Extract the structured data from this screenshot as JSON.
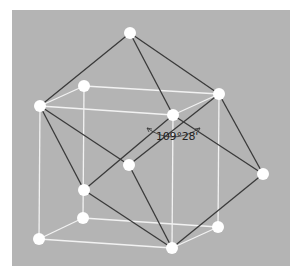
{
  "diagram": {
    "title": "",
    "colors": {
      "background": "#b4b4b4",
      "cube_edge": "#f2f2f2",
      "bond": "#3a3a3a",
      "atom": "#ffffff",
      "arc": "#333333"
    },
    "angle_label": "109°28'",
    "nodes": [
      {
        "id": "top",
        "x": 130,
        "y": 33
      },
      {
        "id": "front-top-left",
        "x": 40,
        "y": 106
      },
      {
        "id": "back-top-left",
        "x": 84,
        "y": 86
      },
      {
        "id": "front-top-right",
        "x": 173,
        "y": 115
      },
      {
        "id": "back-top-right",
        "x": 219,
        "y": 94
      },
      {
        "id": "center",
        "x": 129,
        "y": 165
      },
      {
        "id": "mid-left",
        "x": 84,
        "y": 190
      },
      {
        "id": "right",
        "x": 263,
        "y": 174
      },
      {
        "id": "back-bottom-left",
        "x": 83,
        "y": 218
      },
      {
        "id": "back-bottom-right",
        "x": 218,
        "y": 227
      },
      {
        "id": "front-bottom-left",
        "x": 39,
        "y": 239
      },
      {
        "id": "front-bottom-right",
        "x": 172,
        "y": 248
      }
    ],
    "cube_edges": [
      [
        "front-top-left",
        "front-top-right"
      ],
      [
        "front-top-right",
        "front-bottom-right"
      ],
      [
        "front-bottom-right",
        "front-bottom-left"
      ],
      [
        "front-bottom-left",
        "front-top-left"
      ],
      [
        "back-top-left",
        "back-top-right"
      ],
      [
        "back-top-right",
        "back-bottom-right"
      ],
      [
        "back-bottom-right",
        "back-bottom-left"
      ],
      [
        "back-bottom-left",
        "back-top-left"
      ],
      [
        "front-top-left",
        "back-top-left"
      ],
      [
        "front-top-right",
        "back-top-right"
      ],
      [
        "front-bottom-right",
        "back-bottom-right"
      ],
      [
        "front-bottom-left",
        "back-bottom-left"
      ]
    ],
    "bonds": [
      [
        "top",
        "front-top-left"
      ],
      [
        "top",
        "front-top-right"
      ],
      [
        "top",
        "back-top-right"
      ],
      [
        "front-top-left",
        "center"
      ],
      [
        "front-top-left",
        "mid-left"
      ],
      [
        "mid-left",
        "front-top-right"
      ],
      [
        "center",
        "back-top-right"
      ],
      [
        "front-top-right",
        "right"
      ],
      [
        "back-top-right",
        "right"
      ],
      [
        "mid-left",
        "front-bottom-right"
      ],
      [
        "center",
        "front-bottom-right"
      ],
      [
        "right",
        "front-bottom-right"
      ]
    ]
  }
}
